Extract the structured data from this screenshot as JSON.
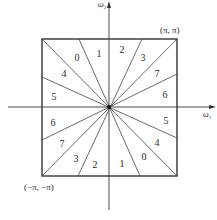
{
  "figure": {
    "type": "frequency-plane-partition",
    "axes": {
      "horizontal_label": "ω",
      "horizontal_subscript": "1",
      "vertical_label": "ω",
      "vertical_subscript": "2"
    },
    "corners": {
      "top_right": "(π, π)",
      "bottom_left": "(−π, −π)"
    },
    "sectors_upper": [
      {
        "label": "5",
        "x": 54,
        "y": 100
      },
      {
        "label": "4",
        "x": 64,
        "y": 77
      },
      {
        "label": "0",
        "x": 77,
        "y": 61
      },
      {
        "label": "1",
        "x": 99,
        "y": 57
      },
      {
        "label": "2",
        "x": 122,
        "y": 53
      },
      {
        "label": "3",
        "x": 143,
        "y": 61
      },
      {
        "label": "7",
        "x": 157,
        "y": 77
      },
      {
        "label": "6",
        "x": 165,
        "y": 98
      }
    ],
    "sectors_lower": [
      {
        "label": "6",
        "x": 53,
        "y": 126
      },
      {
        "label": "7",
        "x": 62,
        "y": 147
      },
      {
        "label": "3",
        "x": 76,
        "y": 162
      },
      {
        "label": "2",
        "x": 95,
        "y": 168
      },
      {
        "label": "1",
        "x": 122,
        "y": 167
      },
      {
        "label": "0",
        "x": 144,
        "y": 160
      },
      {
        "label": "4",
        "x": 157,
        "y": 146
      },
      {
        "label": "5",
        "x": 166,
        "y": 124
      }
    ],
    "colors": {
      "line": "#333333",
      "text": "#2a2a2a",
      "background": "#ffffff"
    }
  }
}
